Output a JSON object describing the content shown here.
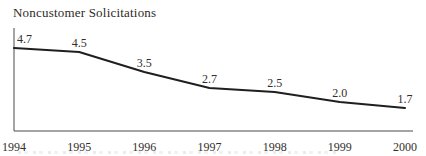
{
  "title": "Noncustomer Solicitations",
  "colors": {
    "line": "#1f1f1f",
    "axis": "#4b4b4b",
    "value_text": "#332f2b",
    "tick_text": "#332f2b",
    "background": "#ffffff"
  },
  "chart_data": {
    "type": "line",
    "title": "Noncustomer Solicitations",
    "categories": [
      "1994",
      "1995",
      "1996",
      "1997",
      "1998",
      "1999",
      "2000"
    ],
    "values": [
      4.7,
      4.5,
      3.5,
      2.7,
      2.5,
      2.0,
      1.7
    ],
    "point_labels": [
      "4.7",
      "4.5",
      "3.5",
      "2.7",
      "2.5",
      "2.0",
      "1.7"
    ],
    "xlabel": "",
    "ylabel": "",
    "ylim": [
      0.55,
      5.7
    ],
    "grid": false,
    "legend": "none",
    "markers": false
  }
}
